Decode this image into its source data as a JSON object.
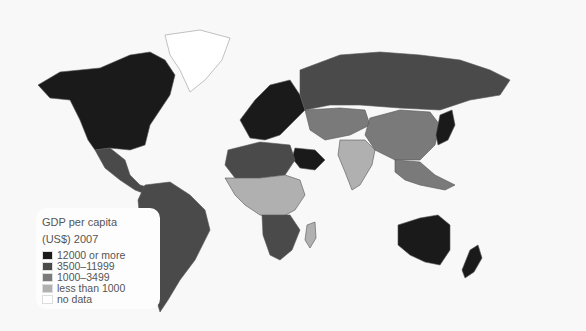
{
  "map": {
    "title_line1": "GDP per capita",
    "title_line2": "(US$) 2007",
    "categories": [
      {
        "key": "high",
        "label": "12000 or more",
        "color": "#1a1a1a"
      },
      {
        "key": "upper",
        "label": "3500–11999",
        "color": "#4a4a4a"
      },
      {
        "key": "middle",
        "label": "1000–3499",
        "color": "#7a7a7a"
      },
      {
        "key": "low",
        "label": "less than 1000",
        "color": "#b0b0b0"
      },
      {
        "key": "nodata",
        "label": "no data",
        "color": "#ffffff"
      }
    ],
    "regions": [
      {
        "name": "North America (USA, Canada)",
        "cat": "high"
      },
      {
        "name": "Greenland",
        "cat": "nodata"
      },
      {
        "name": "Mexico & Central America",
        "cat": "upper"
      },
      {
        "name": "South America",
        "cat": "upper"
      },
      {
        "name": "Western Europe",
        "cat": "high"
      },
      {
        "name": "Russia",
        "cat": "upper"
      },
      {
        "name": "Central Asia",
        "cat": "middle"
      },
      {
        "name": "China",
        "cat": "middle"
      },
      {
        "name": "India",
        "cat": "low"
      },
      {
        "name": "Saudi Arabia",
        "cat": "high"
      },
      {
        "name": "Japan",
        "cat": "high"
      },
      {
        "name": "North Africa",
        "cat": "upper"
      },
      {
        "name": "Sub-Saharan Africa",
        "cat": "low"
      },
      {
        "name": "Southern Africa",
        "cat": "upper"
      },
      {
        "name": "Madagascar",
        "cat": "low"
      },
      {
        "name": "Southeast Asia",
        "cat": "middle"
      },
      {
        "name": "Australia",
        "cat": "high"
      },
      {
        "name": "New Zealand",
        "cat": "high"
      }
    ]
  }
}
